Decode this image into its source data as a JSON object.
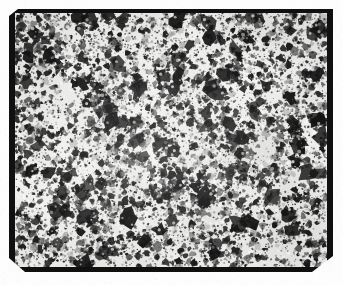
{
  "image": {
    "kind": "scanned-micrograph-plate",
    "subject": "speckled particulate microstructure",
    "width": 343,
    "height": 285,
    "caption": "",
    "visible_text": []
  },
  "canvas": {
    "width": 343,
    "height": 285,
    "background_color": "#fdfdfd"
  },
  "frame": {
    "label": "photographic plate border",
    "x": 9,
    "y": 9,
    "width": 324,
    "height": 263,
    "color": "#101010",
    "border_top": 4,
    "border_right": 6,
    "border_bottom": 5,
    "border_left": 6,
    "notches": [
      {
        "name": "notch-top-left",
        "x": 9,
        "y": 9,
        "width": 9,
        "height": 7
      },
      {
        "name": "notch-bottom-left",
        "x": 9,
        "y": 258,
        "width": 16,
        "height": 14
      },
      {
        "name": "notch-bottom-right",
        "x": 312,
        "y": 256,
        "width": 21,
        "height": 16
      }
    ]
  },
  "field": {
    "label": "micrograph image field",
    "x": 15,
    "y": 13,
    "width": 312,
    "height": 254,
    "base_color": "#f2f2f0",
    "paper_tone": "#ebebe8"
  },
  "texture": {
    "type": "particulate-speckle",
    "seed": 20240517,
    "background_tone": "#f4f4f2",
    "particle_dark": "#1a1a1a",
    "particle_mid": "#4a4a4a",
    "particle_light": "#8a8a8a",
    "blob_count": 4200,
    "fine_count": 5200,
    "cluster_count": 190,
    "min_radius": 0.6,
    "max_radius": 4.2,
    "cluster_radius": 9,
    "blur_px": 0.45,
    "coverage_fraction": 0.34,
    "edge_darkening": 0.06,
    "clear_patches": [
      {
        "cx": 0.44,
        "cy": 0.66,
        "r": 0.065
      },
      {
        "cx": 0.18,
        "cy": 0.3,
        "r": 0.045
      },
      {
        "cx": 0.62,
        "cy": 0.22,
        "r": 0.04
      },
      {
        "cx": 0.8,
        "cy": 0.52,
        "r": 0.038
      },
      {
        "cx": 0.33,
        "cy": 0.86,
        "r": 0.042
      }
    ]
  },
  "grain": {
    "seed": 771,
    "amount": 0.045,
    "color": "#9a9a96"
  }
}
